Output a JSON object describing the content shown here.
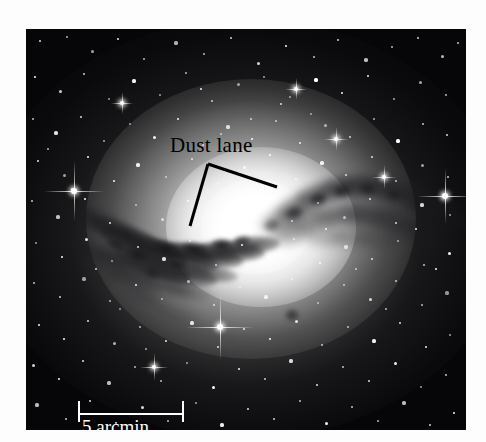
{
  "figure": {
    "kind": "astronomical-photograph",
    "background_color": "#fdfdfd",
    "plate_color": "#060608"
  },
  "annotations": {
    "dust_lane_label": "Dust lane",
    "label_color": "#000000",
    "leader_lines": [
      {
        "name": "leader-left",
        "x1": 208,
        "y1": 164,
        "x2": 190,
        "y2": 226
      },
      {
        "name": "leader-right",
        "x1": 208,
        "y1": 164,
        "x2": 277,
        "y2": 187
      }
    ]
  },
  "scale_bar": {
    "label": "5 arcmin",
    "color": "#ffffff",
    "length_px": 106,
    "value": 5,
    "unit": "arcmin"
  },
  "chart_data": {
    "type": "image",
    "title": "Dust lane",
    "xlabel": "",
    "ylabel": "",
    "scale_reference": {
      "label": "5 arcmin",
      "value": 5,
      "unit": "arcmin",
      "bar_length_px": 106
    },
    "features": [
      {
        "name": "galaxy-halo",
        "description": "diffuse elliptical glow",
        "center": [
          250,
          250
        ]
      },
      {
        "name": "dust-lane",
        "description": "dark absorbing band crossing the bulge diagonally"
      },
      {
        "name": "foreground-stars",
        "description": "point sources across the field"
      }
    ]
  },
  "starfield": {
    "stars": [
      [
        14,
        12,
        1.4
      ],
      [
        41,
        8,
        1.1
      ],
      [
        66,
        22,
        1.5
      ],
      [
        92,
        10,
        1.0
      ],
      [
        118,
        30,
        1.2
      ],
      [
        150,
        14,
        1.6
      ],
      [
        178,
        25,
        1.1
      ],
      [
        205,
        9,
        1.3
      ],
      [
        232,
        34,
        1.5
      ],
      [
        260,
        17,
        1.0
      ],
      [
        288,
        28,
        1.2
      ],
      [
        312,
        11,
        1.4
      ],
      [
        340,
        31,
        1.6
      ],
      [
        366,
        18,
        1.1
      ],
      [
        392,
        9,
        1.3
      ],
      [
        416,
        27,
        1.5
      ],
      [
        432,
        14,
        1.0
      ],
      [
        9,
        48,
        1.2
      ],
      [
        34,
        62,
        1.5
      ],
      [
        58,
        45,
        1.0
      ],
      [
        83,
        70,
        1.3
      ],
      [
        108,
        52,
        1.6
      ],
      [
        134,
        66,
        1.1
      ],
      [
        160,
        44,
        1.4
      ],
      [
        186,
        72,
        1.2
      ],
      [
        212,
        55,
        1.5
      ],
      [
        238,
        48,
        1.0
      ],
      [
        264,
        68,
        1.3
      ],
      [
        290,
        51,
        1.6
      ],
      [
        316,
        64,
        1.1
      ],
      [
        342,
        47,
        1.4
      ],
      [
        368,
        70,
        1.2
      ],
      [
        394,
        53,
        1.5
      ],
      [
        420,
        66,
        1.0
      ],
      [
        7,
        90,
        1.3
      ],
      [
        30,
        104,
        1.6
      ],
      [
        55,
        88,
        1.1
      ],
      [
        78,
        112,
        1.4
      ],
      [
        104,
        95,
        1.2
      ],
      [
        128,
        108,
        1.5
      ],
      [
        152,
        90,
        1.0
      ],
      [
        177,
        116,
        1.3
      ],
      [
        202,
        98,
        1.6
      ],
      [
        226,
        110,
        1.1
      ],
      [
        250,
        92,
        1.4
      ],
      [
        274,
        114,
        1.2
      ],
      [
        299,
        96,
        1.5
      ],
      [
        324,
        108,
        1.0
      ],
      [
        348,
        90,
        1.3
      ],
      [
        372,
        112,
        1.6
      ],
      [
        397,
        95,
        1.1
      ],
      [
        421,
        106,
        1.4
      ],
      [
        12,
        132,
        1.2
      ],
      [
        38,
        146,
        1.5
      ],
      [
        62,
        128,
        1.0
      ],
      [
        88,
        152,
        1.3
      ],
      [
        112,
        136,
        1.6
      ],
      [
        140,
        148,
        1.1
      ],
      [
        166,
        130,
        1.4
      ],
      [
        192,
        154,
        1.2
      ],
      [
        218,
        138,
        1.5
      ],
      [
        244,
        126,
        1.0
      ],
      [
        270,
        150,
        1.3
      ],
      [
        296,
        134,
        1.6
      ],
      [
        320,
        146,
        1.1
      ],
      [
        346,
        128,
        1.4
      ],
      [
        370,
        152,
        1.2
      ],
      [
        396,
        136,
        1.5
      ],
      [
        422,
        148,
        1.0
      ],
      [
        6,
        172,
        1.3
      ],
      [
        32,
        188,
        1.6
      ],
      [
        59,
        170,
        1.1
      ],
      [
        84,
        194,
        1.4
      ],
      [
        110,
        176,
        1.2
      ],
      [
        136,
        190,
        1.5
      ],
      [
        162,
        172,
        1.0
      ],
      [
        188,
        196,
        1.3
      ],
      [
        214,
        178,
        1.6
      ],
      [
        240,
        168,
        1.1
      ],
      [
        266,
        192,
        1.4
      ],
      [
        292,
        174,
        1.2
      ],
      [
        318,
        188,
        1.5
      ],
      [
        344,
        170,
        1.0
      ],
      [
        370,
        194,
        1.3
      ],
      [
        396,
        176,
        1.6
      ],
      [
        424,
        186,
        1.1
      ],
      [
        10,
        214,
        1.4
      ],
      [
        36,
        228,
        1.2
      ],
      [
        60,
        210,
        1.5
      ],
      [
        86,
        232,
        1.0
      ],
      [
        112,
        218,
        1.3
      ],
      [
        138,
        230,
        1.6
      ],
      [
        164,
        212,
        1.1
      ],
      [
        190,
        236,
        1.4
      ],
      [
        216,
        216,
        1.2
      ],
      [
        242,
        228,
        1.5
      ],
      [
        268,
        210,
        1.0
      ],
      [
        294,
        234,
        1.3
      ],
      [
        320,
        218,
        1.6
      ],
      [
        346,
        230,
        1.1
      ],
      [
        372,
        212,
        1.4
      ],
      [
        398,
        236,
        1.2
      ],
      [
        423,
        224,
        1.5
      ],
      [
        8,
        254,
        1.0
      ],
      [
        34,
        268,
        1.3
      ],
      [
        58,
        250,
        1.6
      ],
      [
        84,
        272,
        1.1
      ],
      [
        110,
        256,
        1.4
      ],
      [
        136,
        270,
        1.2
      ],
      [
        162,
        252,
        1.5
      ],
      [
        188,
        276,
        1.0
      ],
      [
        214,
        258,
        1.3
      ],
      [
        240,
        268,
        1.6
      ],
      [
        266,
        250,
        1.1
      ],
      [
        292,
        274,
        1.4
      ],
      [
        318,
        256,
        1.2
      ],
      [
        344,
        270,
        1.5
      ],
      [
        370,
        252,
        1.0
      ],
      [
        396,
        276,
        1.3
      ],
      [
        421,
        264,
        1.6
      ],
      [
        13,
        296,
        1.1
      ],
      [
        38,
        310,
        1.4
      ],
      [
        62,
        292,
        1.2
      ],
      [
        88,
        314,
        1.5
      ],
      [
        114,
        298,
        1.0
      ],
      [
        140,
        312,
        1.3
      ],
      [
        166,
        294,
        1.6
      ],
      [
        192,
        318,
        1.1
      ],
      [
        218,
        300,
        1.4
      ],
      [
        244,
        310,
        1.2
      ],
      [
        270,
        292,
        1.5
      ],
      [
        296,
        316,
        1.0
      ],
      [
        322,
        298,
        1.3
      ],
      [
        348,
        312,
        1.6
      ],
      [
        374,
        294,
        1.1
      ],
      [
        400,
        318,
        1.4
      ],
      [
        424,
        306,
        1.2
      ],
      [
        7,
        336,
        1.5
      ],
      [
        33,
        350,
        1.0
      ],
      [
        57,
        332,
        1.3
      ],
      [
        83,
        354,
        1.6
      ],
      [
        109,
        338,
        1.1
      ],
      [
        135,
        352,
        1.4
      ],
      [
        161,
        334,
        1.2
      ],
      [
        187,
        358,
        1.5
      ],
      [
        213,
        340,
        1.0
      ],
      [
        239,
        350,
        1.3
      ],
      [
        265,
        332,
        1.6
      ],
      [
        291,
        356,
        1.1
      ],
      [
        317,
        338,
        1.4
      ],
      [
        343,
        352,
        1.2
      ],
      [
        369,
        334,
        1.5
      ],
      [
        395,
        358,
        1.0
      ],
      [
        420,
        346,
        1.3
      ],
      [
        11,
        376,
        1.6
      ],
      [
        40,
        390,
        1.1
      ],
      [
        64,
        372,
        1.4
      ],
      [
        90,
        394,
        1.2
      ],
      [
        116,
        378,
        1.5
      ],
      [
        142,
        392,
        1.0
      ],
      [
        170,
        374,
        1.3
      ],
      [
        196,
        396,
        1.6
      ],
      [
        222,
        380,
        1.1
      ],
      [
        248,
        390,
        1.4
      ],
      [
        274,
        372,
        1.2
      ],
      [
        300,
        394,
        1.5
      ],
      [
        326,
        378,
        1.0
      ],
      [
        352,
        392,
        1.3
      ],
      [
        378,
        374,
        1.6
      ],
      [
        404,
        396,
        1.1
      ],
      [
        428,
        384,
        1.4
      ],
      [
        22,
        120,
        1.0
      ],
      [
        46,
        160,
        1.2
      ],
      [
        70,
        240,
        1.1
      ],
      [
        94,
        280,
        1.3
      ],
      [
        120,
        320,
        1.0
      ],
      [
        300,
        200,
        1.1
      ],
      [
        330,
        240,
        1.2
      ],
      [
        360,
        280,
        1.0
      ],
      [
        390,
        200,
        1.3
      ],
      [
        410,
        240,
        1.1
      ],
      [
        175,
        60,
        1.2
      ],
      [
        255,
        75,
        1.4
      ],
      [
        225,
        90,
        1.1
      ],
      [
        195,
        105,
        1.0
      ],
      [
        285,
        85,
        1.2
      ]
    ],
    "bright_stars": [
      {
        "x": 48,
        "y": 162,
        "r": 3.2,
        "spike": 30
      },
      {
        "x": 419,
        "y": 167,
        "r": 3.0,
        "spike": 28
      },
      {
        "x": 194,
        "y": 298,
        "r": 3.4,
        "spike": 34
      },
      {
        "x": 128,
        "y": 338,
        "r": 2.2,
        "spike": 14
      },
      {
        "x": 310,
        "y": 110,
        "r": 2.0,
        "spike": 12
      },
      {
        "x": 358,
        "y": 148,
        "r": 2.0,
        "spike": 12
      },
      {
        "x": 270,
        "y": 60,
        "r": 1.9,
        "spike": 11
      },
      {
        "x": 96,
        "y": 74,
        "r": 1.9,
        "spike": 11
      }
    ]
  }
}
